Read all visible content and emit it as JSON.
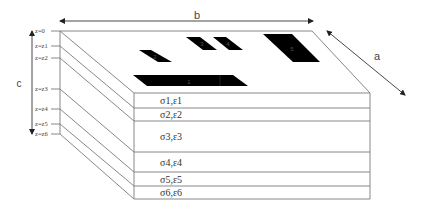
{
  "diagram": {
    "dimensions": {
      "length_label": "b",
      "width_label": "a",
      "thickness_label": "c"
    },
    "z_levels": [
      "z=0",
      "z=z1",
      "z=z2",
      "z=z3",
      "z=z4",
      "z=z5",
      "z=z6"
    ],
    "layers": [
      {
        "label": "σ1,ε1"
      },
      {
        "label": "σ2,ε2"
      },
      {
        "label": "σ3,ε3"
      },
      {
        "label": "σ4,ε4"
      },
      {
        "label": "σ5,ε5"
      },
      {
        "label": "σ6,ε6"
      }
    ],
    "patches": [
      {
        "label": "1"
      },
      {
        "label": "2"
      },
      {
        "label": "3"
      },
      {
        "label": "4"
      },
      {
        "label": "5"
      }
    ],
    "colors": {
      "patch_fill": "#000000",
      "edge_stroke": "#7a7a7a",
      "background": "#ffffff"
    }
  }
}
